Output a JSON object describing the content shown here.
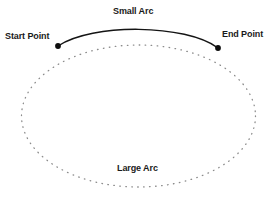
{
  "diagram": {
    "type": "arc-geometry-illustration",
    "background_color": "#ffffff",
    "stroke_color": "#1a1a1a",
    "labels": {
      "start_point": "Start Point",
      "end_point": "End Point",
      "small_arc": "Small Arc",
      "large_arc": "Large Arc"
    },
    "geometry": {
      "ellipse": {
        "center_x": 138.5,
        "center_y": 116,
        "radius_x": 117,
        "radius_y": 71,
        "style": "dotted",
        "dot_color": "#8c8c8c"
      },
      "start_point": {
        "x": 58,
        "y": 46,
        "marker": "filled-dot",
        "radius": 2.8
      },
      "end_point": {
        "x": 218,
        "y": 48,
        "marker": "filled-dot",
        "radius": 2.8
      },
      "small_arc": {
        "style": "solid",
        "stroke_width": 1.4,
        "apex_y": 30,
        "description": "short solid arc sweeping above from start point to end point"
      },
      "large_arc": {
        "style": "dotted",
        "description": "remaining long dotted portion of the ellipse below"
      }
    }
  }
}
